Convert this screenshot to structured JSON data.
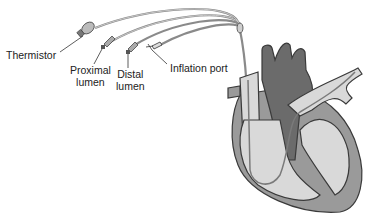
{
  "diagram": {
    "labels": {
      "thermistor": "Thermistor",
      "proximal_lumen_line1": "Proximal",
      "proximal_lumen_line2": "lumen",
      "distal_lumen_line1": "Distal",
      "distal_lumen_line2": "lumen",
      "inflation_port": "Inflation port"
    },
    "colors": {
      "outline": "#3a3a3a",
      "dark_vessel": "#6b6b6b",
      "mid_gray": "#9a9a9a",
      "light_gray": "#d9d9d9",
      "background": "#ffffff"
    }
  }
}
